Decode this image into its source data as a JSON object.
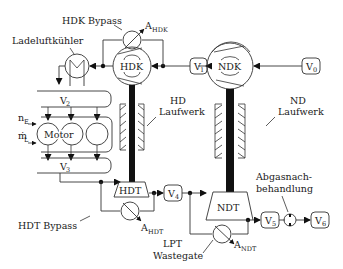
{
  "diagram": {
    "components": {
      "hdk": "HDK",
      "ndk": "NDK",
      "hdt": "HDT",
      "ndt": "NDT",
      "motor": "Motor"
    },
    "volumes": {
      "v0": "V",
      "v0_sub": "0",
      "v1": "V",
      "v1_sub": "1",
      "v2": "V",
      "v2_sub": "2",
      "v3": "V",
      "v3_sub": "3",
      "v4": "V",
      "v4_sub": "4",
      "v5": "V",
      "v5_sub": "5",
      "v6": "V",
      "v6_sub": "6"
    },
    "labels": {
      "hdk_bypass": "HDK Bypass",
      "a_hdk": "A",
      "a_hdk_sub": "HDK",
      "ladeluftkuehler": "Ladeluftkühler",
      "hd_laufwerk_1": "HD",
      "hd_laufwerk_2": "Laufwerk",
      "nd_laufwerk_1": "ND",
      "nd_laufwerk_2": "Laufwerk",
      "n_e": "n",
      "n_e_sub": "E",
      "m_l": "ṁ",
      "m_l_sub": "L",
      "hdt_bypass": "HDT Bypass",
      "a_hdt": "A",
      "a_hdt_sub": "HDT",
      "lpt_1": "LPT",
      "lpt_2": "Wastegate",
      "a_ndt": "A",
      "a_ndt_sub": "NDT",
      "abgas_1": "Abgasnach-",
      "abgas_2": "behandlung"
    }
  }
}
